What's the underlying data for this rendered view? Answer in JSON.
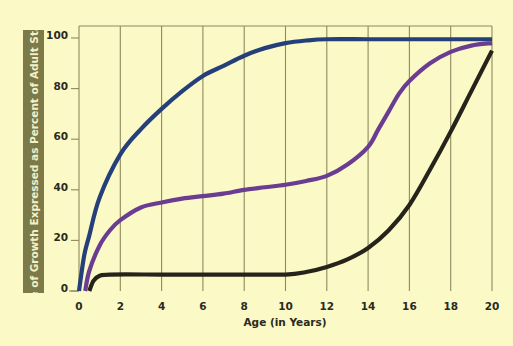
{
  "chart_data": {
    "type": "line",
    "title": "",
    "xlabel": "Age (in Years)",
    "ylabel": "Rate of Growth Expressed as Percent of Adult Status",
    "xlim": [
      0,
      20
    ],
    "ylim": [
      0,
      100
    ],
    "x_ticks": [
      0,
      2,
      4,
      6,
      8,
      10,
      12,
      14,
      16,
      18,
      20
    ],
    "y_ticks": [
      0,
      20,
      40,
      60,
      80,
      100
    ],
    "grid": {
      "vertical": true,
      "horizontal": false
    },
    "legend": null,
    "series": [
      {
        "name": "blue-curve",
        "color": "#243f7a",
        "points": [
          [
            0,
            0
          ],
          [
            0.25,
            14
          ],
          [
            0.5,
            22
          ],
          [
            1,
            37
          ],
          [
            2,
            54
          ],
          [
            3,
            64
          ],
          [
            4,
            72
          ],
          [
            5,
            79
          ],
          [
            6,
            85
          ],
          [
            7,
            89
          ],
          [
            8,
            93
          ],
          [
            9,
            96
          ],
          [
            10,
            98
          ],
          [
            11,
            99
          ],
          [
            12,
            99.5
          ],
          [
            14,
            99.5
          ],
          [
            16,
            99.5
          ],
          [
            18,
            99.5
          ],
          [
            20,
            99.5
          ]
        ]
      },
      {
        "name": "purple-curve",
        "color": "#6a3c92",
        "points": [
          [
            0.3,
            0
          ],
          [
            0.5,
            8
          ],
          [
            1,
            18
          ],
          [
            1.5,
            24
          ],
          [
            2,
            28
          ],
          [
            3,
            33
          ],
          [
            4,
            35
          ],
          [
            5,
            36.5
          ],
          [
            6,
            37.5
          ],
          [
            7,
            38.5
          ],
          [
            8,
            40
          ],
          [
            9,
            41
          ],
          [
            10,
            42
          ],
          [
            11,
            43.5
          ],
          [
            12,
            45.5
          ],
          [
            13,
            50
          ],
          [
            14,
            57
          ],
          [
            14.5,
            64
          ],
          [
            15,
            71
          ],
          [
            15.5,
            78
          ],
          [
            16,
            83
          ],
          [
            17,
            90
          ],
          [
            18,
            94.5
          ],
          [
            19,
            97
          ],
          [
            20,
            98
          ]
        ]
      },
      {
        "name": "black-curve",
        "color": "#25231a",
        "points": [
          [
            0.5,
            0
          ],
          [
            0.7,
            4
          ],
          [
            1,
            6
          ],
          [
            1.5,
            6.5
          ],
          [
            4,
            6.5
          ],
          [
            6,
            6.5
          ],
          [
            8,
            6.5
          ],
          [
            10,
            6.5
          ],
          [
            11,
            7.5
          ],
          [
            12,
            9.5
          ],
          [
            13,
            12.5
          ],
          [
            14,
            17
          ],
          [
            15,
            24
          ],
          [
            16,
            34
          ],
          [
            17,
            48
          ],
          [
            18,
            63
          ],
          [
            19,
            79
          ],
          [
            20,
            95
          ]
        ]
      }
    ]
  },
  "axes": {
    "y_label": "Rate of Growth Expressed as Percent of Adult Status",
    "x_label": "Age (in Years)",
    "x_tick_labels": [
      "0",
      "2",
      "4",
      "6",
      "8",
      "10",
      "12",
      "14",
      "16",
      "18",
      "20"
    ],
    "y_tick_labels": [
      "0",
      "20",
      "40",
      "60",
      "80",
      "100"
    ]
  },
  "colors": {
    "background": "#fbf9c6",
    "label_box": "#7b7a48",
    "grid": "#8d8a5e"
  }
}
